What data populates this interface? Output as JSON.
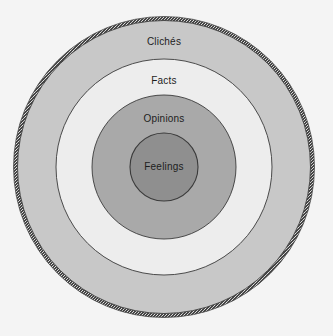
{
  "diagram": {
    "type": "concentric-circles",
    "title": "",
    "background_color": "#f4f4f4",
    "center": {
      "x": 164,
      "y": 167
    },
    "outer_border": {
      "name": "textured-outer-ring",
      "radius": 150,
      "color": "#3c3c3c",
      "style": "stippled"
    },
    "rings": [
      {
        "label": "Clichés",
        "outer_radius": 147,
        "inner_radius": 108,
        "fill": "#c8c8c8",
        "stroke": "#3a3a3a",
        "label_color": "#1d1d1d"
      },
      {
        "label": "Facts",
        "outer_radius": 108,
        "inner_radius": 72,
        "fill": "#ededed",
        "stroke": "#3a3a3a",
        "label_color": "#1d1d1d"
      },
      {
        "label": "Opinions",
        "outer_radius": 72,
        "inner_radius": 34,
        "fill": "#a9a9a9",
        "stroke": "#3a3a3a",
        "label_color": "#1d1d1d"
      },
      {
        "label": "Feelings",
        "outer_radius": 34,
        "inner_radius": 0,
        "fill": "#8f8f8f",
        "stroke": "#3a3a3a",
        "label_color": "#1d1d1d"
      }
    ]
  }
}
